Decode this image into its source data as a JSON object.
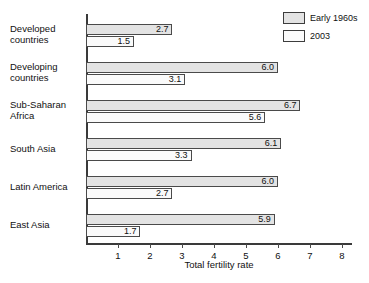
{
  "chart_data": {
    "type": "bar",
    "orientation": "horizontal",
    "title": "",
    "xlabel": "Total fertility rate",
    "ylabel": "",
    "xlim": [
      0,
      8.4
    ],
    "xticks": [
      1,
      2,
      3,
      4,
      5,
      6,
      7,
      8
    ],
    "grid": false,
    "legend_position": "top-right",
    "categories": [
      "Developed countries",
      "Developing countries",
      "Sub-Saharan Africa",
      "South Asia",
      "Latin America",
      "East Asia"
    ],
    "series": [
      {
        "name": "Early 1960s",
        "color": "#e3e3e3",
        "values": [
          2.7,
          6.0,
          6.7,
          6.1,
          6.0,
          5.9
        ],
        "labels": [
          "2.7",
          "6.0",
          "6.7",
          "6.1",
          "6.0",
          "5.9"
        ]
      },
      {
        "name": "2003",
        "color": "#fafafa",
        "values": [
          1.5,
          3.1,
          5.6,
          3.3,
          2.7,
          1.7
        ],
        "labels": [
          "1.5",
          "3.1",
          "5.6",
          "3.3",
          "2.7",
          "1.7"
        ]
      }
    ]
  },
  "legend": {
    "items": [
      {
        "label": "Early 1960s"
      },
      {
        "label": "2003"
      }
    ]
  },
  "axis": {
    "x_title": "Total fertility rate",
    "tick_labels": [
      "1",
      "2",
      "3",
      "4",
      "5",
      "6",
      "7",
      "8"
    ]
  },
  "category_labels": [
    "Developed countries",
    "Developing countries",
    "Sub-Saharan Africa",
    "South Asia",
    "Latin America",
    "East Asia"
  ],
  "colors": {
    "series_early": "#e3e3e3",
    "series_recent": "#fafafa",
    "axis": "#3a3a3a",
    "text": "#111111"
  }
}
